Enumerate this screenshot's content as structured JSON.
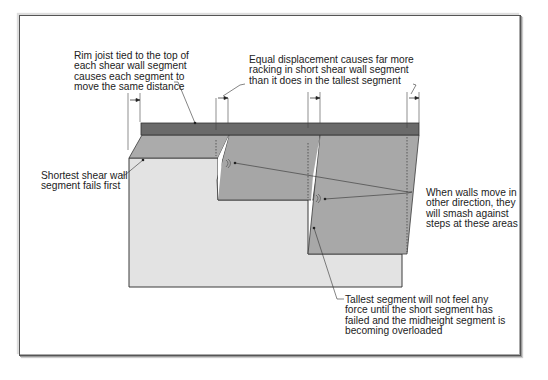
{
  "diagram": {
    "type": "shear wall segments of unequal height under lateral displacement",
    "colors": {
      "rim_joist": "#6a6a6a",
      "segment_top_face": "#a9a9a9",
      "segment_front": "#e4e4e4",
      "segment_dark": "#a6a6a6",
      "outline": "#3a3a3a",
      "frame_border": "#555555"
    },
    "annotations": {
      "rim_joist": "Rim joist tied to the top of\neach shear wall segment\ncauses each segment to\nmove the same distance",
      "equal_displacement": "Equal displacement causes far more\nracking in short shear wall segment\nthan it does in the tallest segment",
      "shortest_fails": "Shortest shear wall\nsegment fails first",
      "smash_steps": "When walls move in\nother direction, they\nwill smash against\nsteps at these areas",
      "tallest_segment": "Tallest segment will not feel any\nforce until the short segment has\nfailed and the midheight segment is\nbecoming overloaded"
    },
    "icons": [
      "impact-mark-icon",
      "impact-mark-icon",
      "displacement-arrow-icon",
      "displacement-arrow-icon",
      "displacement-arrow-icon"
    ]
  }
}
